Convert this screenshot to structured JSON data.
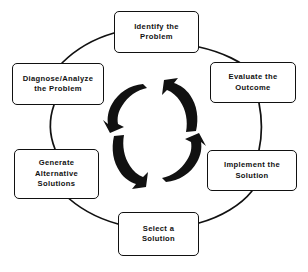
{
  "diagram": {
    "type": "cycle",
    "title": "",
    "shape": "circular-flow",
    "direction": "clockwise",
    "colors": {
      "stroke": "#111111",
      "background": "#ffffff",
      "arrow_fill": "#111111"
    },
    "nodes": [
      {
        "id": "identify",
        "label": "Identify the\nProblem",
        "position": "top"
      },
      {
        "id": "evaluate",
        "label": "Evaluate the\nOutcome",
        "position": "top-right"
      },
      {
        "id": "implement",
        "label": "Implement the\nSolution",
        "position": "bottom-right"
      },
      {
        "id": "select",
        "label": "Select a\nSolution",
        "position": "bottom"
      },
      {
        "id": "generate",
        "label": "Generate\nAlternative\nSolutions",
        "position": "bottom-left"
      },
      {
        "id": "diagnose",
        "label": "Diagnose/Analyze\nthe Problem",
        "position": "top-left"
      }
    ],
    "center_arrows": {
      "count": 4,
      "description": "four curved rotation arrows",
      "names": [
        "rotation-arrow-upper-left",
        "rotation-arrow-upper-right",
        "rotation-arrow-lower-left",
        "rotation-arrow-lower-right"
      ]
    }
  }
}
